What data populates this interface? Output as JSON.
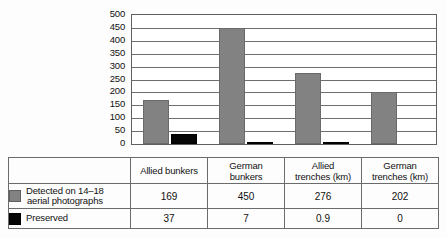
{
  "chart_data": {
    "type": "bar",
    "title": "",
    "subtitle": "",
    "xlabel": "",
    "ylabel": "",
    "ylim": [
      0,
      500
    ],
    "y_ticks": [
      0,
      50,
      100,
      150,
      200,
      250,
      300,
      350,
      400,
      450,
      500
    ],
    "grid": true,
    "legend_position": "table-left",
    "categories": [
      "Allied bunkers",
      "German bunkers",
      "Allied trenches (km)",
      "German trenches (km)"
    ],
    "category_lines": [
      [
        "Allied bunkers"
      ],
      [
        "German",
        "bunkers"
      ],
      [
        "Allied",
        "trenches (km)"
      ],
      [
        "German",
        "trenches (km)"
      ]
    ],
    "series": [
      {
        "name": "Detected on 14–18 aerial photographs",
        "name_lines": [
          "Detected on 14–18",
          "aerial photographs"
        ],
        "color": "#828282",
        "values": [
          169,
          450,
          276,
          202
        ],
        "value_labels": [
          "169",
          "450",
          "276",
          "202"
        ]
      },
      {
        "name": "Preserved",
        "name_lines": [
          "Preserved"
        ],
        "color": "#060606",
        "values": [
          37,
          7,
          0.9,
          0
        ],
        "value_labels": [
          "37",
          "7",
          "0.9",
          "0"
        ]
      }
    ]
  },
  "y_axis": {
    "labels": [
      "500",
      "450",
      "400",
      "350",
      "300",
      "250",
      "200",
      "150",
      "100",
      "50",
      "0"
    ]
  },
  "table": {
    "corner_blank": "",
    "headers": [
      "Allied bunkers",
      "German bunkers",
      "Allied trenches (km)",
      "German trenches (km)"
    ],
    "rows": [
      {
        "label": "Detected on 14–18 aerial photographs",
        "label_line1": "Detected on 14–18",
        "label_line2": "aerial photographs",
        "swatch": "gray-swatch-icon",
        "values": [
          "169",
          "450",
          "276",
          "202"
        ]
      },
      {
        "label": "Preserved",
        "label_line1": "Preserved",
        "label_line2": "",
        "swatch": "black-swatch-icon",
        "values": [
          "37",
          "7",
          "0.9",
          "0"
        ]
      }
    ]
  },
  "colors": {
    "detected": "#828282",
    "preserved": "#060606",
    "axis": "#5f5f5f",
    "grid": "#6e6e6e",
    "background": "#ffffff"
  }
}
